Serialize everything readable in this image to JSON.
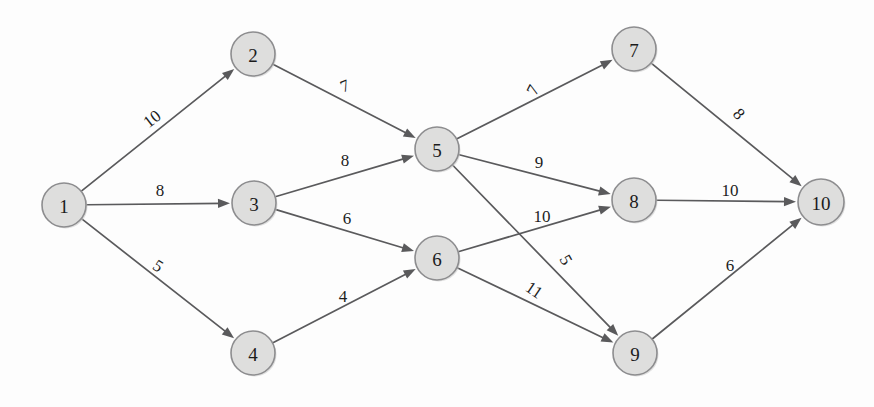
{
  "figure": {
    "type": "directed-weighted-graph",
    "width": 874,
    "height": 407,
    "background_color": "#fdfdfd",
    "node_fill_color": "#dededd",
    "node_stroke_color": "#8d8d8f",
    "edge_color": "#5a5a5c",
    "label_color": "#1d1d1d"
  },
  "chart_data": {
    "type": "diagram",
    "title": "",
    "node_count": 10,
    "edge_count": 15,
    "nodes": [
      {
        "id": "1",
        "label": "1",
        "x": 64,
        "y": 205,
        "r": 22
      },
      {
        "id": "2",
        "label": "2",
        "x": 253,
        "y": 54,
        "r": 22
      },
      {
        "id": "3",
        "label": "3",
        "x": 254,
        "y": 203,
        "r": 22
      },
      {
        "id": "4",
        "label": "4",
        "x": 253,
        "y": 353,
        "r": 22
      },
      {
        "id": "5",
        "label": "5",
        "x": 437,
        "y": 149,
        "r": 22
      },
      {
        "id": "6",
        "label": "6",
        "x": 437,
        "y": 258,
        "r": 22
      },
      {
        "id": "7",
        "label": "7",
        "x": 634,
        "y": 49,
        "r": 22
      },
      {
        "id": "8",
        "label": "8",
        "x": 634,
        "y": 200,
        "r": 22
      },
      {
        "id": "9",
        "label": "9",
        "x": 635,
        "y": 353,
        "r": 22
      },
      {
        "id": "10",
        "label": "10",
        "x": 821,
        "y": 202,
        "r": 23
      }
    ],
    "edges": [
      {
        "from": "1",
        "to": "2",
        "weight": "10",
        "lx": 152,
        "ly": 119,
        "rot": -38
      },
      {
        "from": "1",
        "to": "3",
        "weight": "8",
        "lx": 160,
        "ly": 190,
        "rot": 0
      },
      {
        "from": "1",
        "to": "4",
        "weight": "5",
        "lx": 158,
        "ly": 266,
        "rot": 33
      },
      {
        "from": "2",
        "to": "5",
        "weight": "7",
        "lx": 345,
        "ly": 86,
        "rot": -22
      },
      {
        "from": "3",
        "to": "5",
        "weight": "8",
        "lx": 345,
        "ly": 160,
        "rot": 0
      },
      {
        "from": "3",
        "to": "6",
        "weight": "6",
        "lx": 347,
        "ly": 218,
        "rot": 0
      },
      {
        "from": "4",
        "to": "6",
        "weight": "4",
        "lx": 343,
        "ly": 296,
        "rot": 0
      },
      {
        "from": "5",
        "to": "7",
        "weight": "7",
        "lx": 533,
        "ly": 90,
        "rot": -63
      },
      {
        "from": "5",
        "to": "8",
        "weight": "9",
        "lx": 539,
        "ly": 162,
        "rot": 0
      },
      {
        "from": "5",
        "to": "9",
        "weight": "5",
        "lx": 566,
        "ly": 260,
        "rot": 60
      },
      {
        "from": "6",
        "to": "8",
        "weight": "10",
        "lx": 542,
        "ly": 216,
        "rot": 0
      },
      {
        "from": "6",
        "to": "9",
        "weight": "11",
        "lx": 534,
        "ly": 290,
        "rot": 34
      },
      {
        "from": "7",
        "to": "10",
        "weight": "8",
        "lx": 739,
        "ly": 114,
        "rot": 48
      },
      {
        "from": "8",
        "to": "10",
        "weight": "10",
        "lx": 730,
        "ly": 190,
        "rot": 0
      },
      {
        "from": "9",
        "to": "10",
        "weight": "6",
        "lx": 730,
        "ly": 265,
        "rot": 0
      }
    ]
  }
}
